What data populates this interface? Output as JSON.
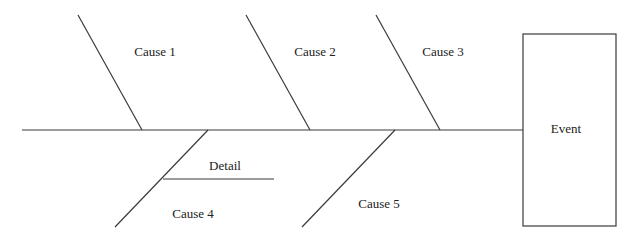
{
  "diagram": {
    "type": "fishbone",
    "effect": {
      "label": "Event"
    },
    "causes": [
      {
        "label": "Cause 1"
      },
      {
        "label": "Cause 2"
      },
      {
        "label": "Cause 3"
      },
      {
        "label": "Cause 4",
        "details": [
          {
            "label": "Detail"
          }
        ]
      },
      {
        "label": "Cause 5"
      }
    ]
  }
}
